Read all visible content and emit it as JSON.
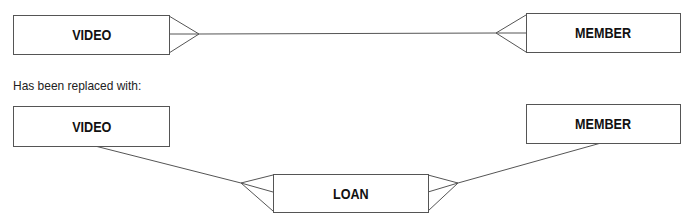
{
  "before": {
    "entities": [
      {
        "id": "video",
        "label": "VIDEO"
      },
      {
        "id": "member",
        "label": "MEMBER"
      }
    ],
    "relationships": [
      {
        "from": "VIDEO",
        "to": "MEMBER",
        "type": "many-to-many"
      }
    ]
  },
  "caption": "Has been replaced with:",
  "after": {
    "entities": [
      {
        "id": "video",
        "label": "VIDEO"
      },
      {
        "id": "member",
        "label": "MEMBER"
      },
      {
        "id": "loan",
        "label": "LOAN"
      }
    ],
    "relationships": [
      {
        "from": "VIDEO",
        "to": "LOAN",
        "type": "one-to-many"
      },
      {
        "from": "MEMBER",
        "to": "LOAN",
        "type": "one-to-many"
      }
    ]
  },
  "colors": {
    "line": "#555555",
    "text": "#111111",
    "background": "#ffffff"
  }
}
